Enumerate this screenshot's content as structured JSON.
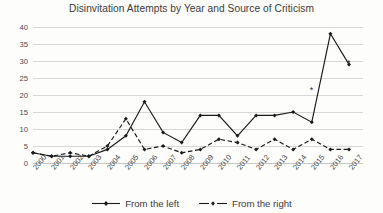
{
  "chart_data": {
    "type": "line",
    "title": "Disinvitation Attempts by Year and Source of Criticism",
    "xlabel": "",
    "ylabel": "",
    "ylim": [
      0,
      40
    ],
    "yticks": [
      0,
      5,
      10,
      15,
      20,
      25,
      30,
      35,
      40
    ],
    "grid": true,
    "legend_position": "bottom",
    "categories": [
      "2000",
      "2001",
      "2002",
      "2003",
      "2004",
      "2005",
      "2006",
      "2007",
      "2008",
      "2009",
      "2010",
      "2011",
      "2012",
      "2013",
      "2014",
      "2015",
      "2016",
      "2017"
    ],
    "series": [
      {
        "name": "From the left",
        "style": "solid",
        "marker": "filled-diamond",
        "color": "#1a1a1a",
        "values": [
          3,
          2,
          2,
          2,
          4,
          8,
          18,
          9,
          6,
          14,
          14,
          8,
          14,
          14,
          15,
          12,
          38,
          29
        ]
      },
      {
        "name": "From the right",
        "style": "dashed",
        "marker": "filled-diamond",
        "color": "#1a1a1a",
        "values": [
          3,
          2,
          3,
          2,
          5,
          13,
          4,
          5,
          3,
          4,
          7,
          6,
          4,
          7,
          4,
          7,
          4,
          4
        ]
      }
    ],
    "annotations": [
      {
        "text": "*",
        "x": "2015",
        "y": 22
      },
      {
        "text": "*",
        "x": "2017",
        "y": 30
      }
    ]
  },
  "legend": {
    "items": [
      {
        "label": "From the left",
        "style": "solid"
      },
      {
        "label": "From the right",
        "style": "dashed"
      }
    ]
  }
}
